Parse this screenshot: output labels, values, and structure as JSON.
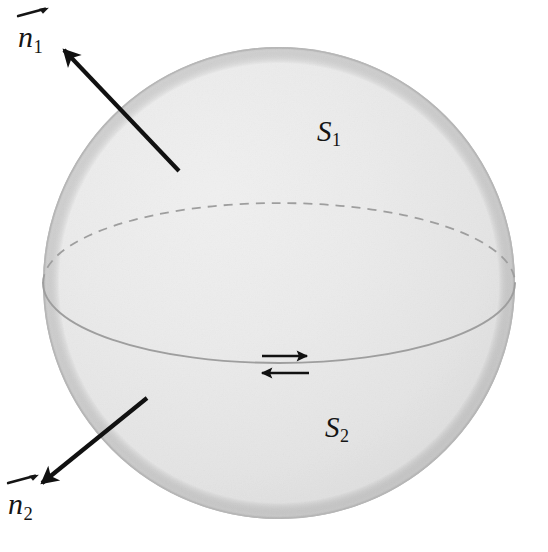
{
  "figure": {
    "background_color": "#ffffff",
    "sphere": {
      "fill_light": "#ececec",
      "fill_mid": "#e2e2e2",
      "fill_dark": "#cfcfcf",
      "outline_color": "#b6b6b6",
      "center_x": 279,
      "center_y": 283,
      "radius": 236
    },
    "equator": {
      "center_x": 279,
      "center_y": 283,
      "radius_x": 236,
      "radius_y": 80,
      "front_style": "solid",
      "back_style": "dashed",
      "stroke_color": "#9e9e9e",
      "dash_pattern": "9 7"
    },
    "labels": [
      {
        "name": "normal-vector-top",
        "symbol": "n",
        "subscript": "1",
        "has_vector_arrow": true,
        "x": 18,
        "y": 22
      },
      {
        "name": "normal-vector-bottom",
        "symbol": "n",
        "subscript": "2",
        "has_vector_arrow": true,
        "x": 8,
        "y": 489
      },
      {
        "name": "surface-upper",
        "symbol": "S",
        "subscript": "1",
        "has_vector_arrow": false,
        "x": 317,
        "y": 117
      },
      {
        "name": "surface-lower",
        "symbol": "S",
        "subscript": "2",
        "has_vector_arrow": false,
        "x": 325,
        "y": 413
      }
    ],
    "normal_arrows": [
      {
        "name": "normal-arrow-upper",
        "from_x": 179,
        "from_y": 171,
        "to_x": 64,
        "to_y": 50,
        "color": "#111111",
        "width": 4.2
      },
      {
        "name": "normal-arrow-lower",
        "from_x": 147,
        "from_y": 398,
        "to_x": 42,
        "to_y": 483,
        "color": "#111111",
        "width": 4.2
      }
    ],
    "boundary_arrows": [
      {
        "name": "boundary-arrow-right",
        "direction": "right",
        "from_x": 262,
        "from_y": 356,
        "to_x": 307,
        "to_y": 356,
        "color": "#111111",
        "width": 2.6
      },
      {
        "name": "boundary-arrow-left",
        "direction": "left",
        "from_x": 309,
        "from_y": 373,
        "to_x": 262,
        "to_y": 373,
        "color": "#111111",
        "width": 2.6
      }
    ]
  }
}
